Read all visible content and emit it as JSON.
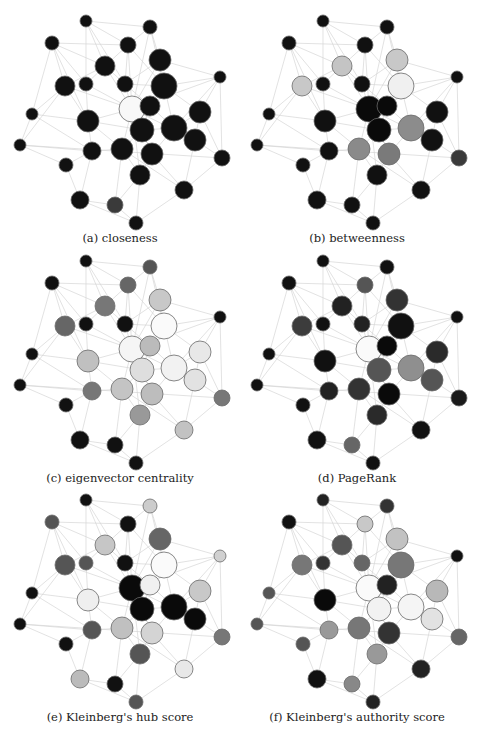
{
  "figure": {
    "panels": [
      {
        "id": "a",
        "caption": "(a) closeness",
        "offset": [
          0,
          0
        ],
        "fills": [
          "#111111",
          "#111111",
          "#111111",
          "#111111",
          "#111111",
          "#111111",
          "#111111",
          "#111111",
          "#111111",
          "#111111",
          "#111111",
          "#f8f8f8",
          "#111111",
          "#111111",
          "#111111",
          "#111111",
          "#111111",
          "#111111",
          "#111111",
          "#111111",
          "#111111",
          "#111111",
          "#111111",
          "#111111",
          "#111111",
          "#111111",
          "#111111",
          "#111111",
          "#3a3a3a",
          "#111111"
        ]
      },
      {
        "id": "b",
        "caption": "(b) betweenness",
        "offset": [
          237,
          0
        ],
        "fills": [
          "#111111",
          "#111111",
          "#111111",
          "#111111",
          "#c8c8c8",
          "#c4c4c4",
          "#c8c8c8",
          "#111111",
          "#111111",
          "#f0f0f0",
          "#111111",
          "#0a0a0a",
          "#0a0a0a",
          "#111111",
          "#111111",
          "#111111",
          "#0a0a0a",
          "#8c8c8c",
          "#111111",
          "#111111",
          "#111111",
          "#8a8a8a",
          "#7a7a7a",
          "#3a3a3a",
          "#111111",
          "#111111",
          "#111111",
          "#111111",
          "#111111",
          "#111111"
        ]
      },
      {
        "id": "c",
        "caption": "(c) eigenvector centrality",
        "offset": [
          0,
          240
        ],
        "fills": [
          "#111111",
          "#555555",
          "#111111",
          "#666666",
          "#c8c8c8",
          "#777777",
          "#666666",
          "#111111",
          "#111111",
          "#fafafa",
          "#111111",
          "#f5f5f5",
          "#bbbbbb",
          "#111111",
          "#c0c0c0",
          "#e8e8e8",
          "#dedede",
          "#f2f2f2",
          "#e2e2e2",
          "#111111",
          "#777777",
          "#c4c4c4",
          "#bdbdbd",
          "#777777",
          "#111111",
          "#999999",
          "#c2c2c2",
          "#111111",
          "#111111",
          "#111111"
        ]
      },
      {
        "id": "d",
        "caption": "(d) PageRank",
        "offset": [
          237,
          240
        ],
        "fills": [
          "#111111",
          "#111111",
          "#111111",
          "#555555",
          "#333333",
          "#222222",
          "#3c3c3c",
          "#111111",
          "#222222",
          "#111111",
          "#111111",
          "#fafafa",
          "#0a0a0a",
          "#111111",
          "#111111",
          "#2a2a2a",
          "#555555",
          "#8f8f8f",
          "#555555",
          "#111111",
          "#222222",
          "#333333",
          "#0a0a0a",
          "#1a1a1a",
          "#111111",
          "#2a2a2a",
          "#111111",
          "#111111",
          "#666666",
          "#111111"
        ]
      },
      {
        "id": "e",
        "caption": "(e) Kleinberg's hub score",
        "offset": [
          0,
          479
        ],
        "fills": [
          "#111111",
          "#cccccc",
          "#555555",
          "#111111",
          "#666666",
          "#c6c6c6",
          "#555555",
          "#555555",
          "#111111",
          "#fafafa",
          "#d0d0d0",
          "#0a0a0a",
          "#f0f0f0",
          "#111111",
          "#efefef",
          "#c8c8c8",
          "#0a0a0a",
          "#0a0a0a",
          "#0a0a0a",
          "#111111",
          "#555555",
          "#c0c0c0",
          "#d4d4d4",
          "#777777",
          "#111111",
          "#555555",
          "#e8e8e8",
          "#bbbbbb",
          "#111111",
          "#555555"
        ]
      },
      {
        "id": "f",
        "caption": "(f) Kleinberg's authority score",
        "offset": [
          237,
          479
        ],
        "fills": [
          "#222222",
          "#333333",
          "#111111",
          "#c8c8c8",
          "#c2c2c2",
          "#555555",
          "#777777",
          "#333333",
          "#666666",
          "#777777",
          "#111111",
          "#fafafa",
          "#222222",
          "#555555",
          "#0a0a0a",
          "#b8b8b8",
          "#f2f2f2",
          "#f5f5f5",
          "#e2e2e2",
          "#555555",
          "#999999",
          "#777777",
          "#333333",
          "#666666",
          "#555555",
          "#999999",
          "#222222",
          "#111111",
          "#888888",
          "#222222"
        ]
      }
    ],
    "bottom_caption_cropped": true
  },
  "graph": {
    "nodes": [
      {
        "x": 86,
        "y": 21,
        "r": 6
      },
      {
        "x": 150,
        "y": 27,
        "r": 7
      },
      {
        "x": 52,
        "y": 43,
        "r": 7
      },
      {
        "x": 128,
        "y": 45,
        "r": 8
      },
      {
        "x": 160,
        "y": 60,
        "r": 11
      },
      {
        "x": 105,
        "y": 66,
        "r": 10
      },
      {
        "x": 65,
        "y": 86,
        "r": 10
      },
      {
        "x": 86,
        "y": 84,
        "r": 7
      },
      {
        "x": 125,
        "y": 84,
        "r": 8
      },
      {
        "x": 164,
        "y": 86,
        "r": 13
      },
      {
        "x": 220,
        "y": 77,
        "r": 6
      },
      {
        "x": 132,
        "y": 109,
        "r": 13
      },
      {
        "x": 150,
        "y": 106,
        "r": 10
      },
      {
        "x": 32,
        "y": 114,
        "r": 6
      },
      {
        "x": 88,
        "y": 121,
        "r": 11
      },
      {
        "x": 200,
        "y": 112,
        "r": 11
      },
      {
        "x": 142,
        "y": 130,
        "r": 12
      },
      {
        "x": 174,
        "y": 128,
        "r": 13
      },
      {
        "x": 195,
        "y": 140,
        "r": 11
      },
      {
        "x": 20,
        "y": 145,
        "r": 6
      },
      {
        "x": 92,
        "y": 151,
        "r": 9
      },
      {
        "x": 122,
        "y": 149,
        "r": 11
      },
      {
        "x": 152,
        "y": 154,
        "r": 11
      },
      {
        "x": 222,
        "y": 158,
        "r": 8
      },
      {
        "x": 66,
        "y": 165,
        "r": 7
      },
      {
        "x": 140,
        "y": 175,
        "r": 10
      },
      {
        "x": 184,
        "y": 190,
        "r": 9
      },
      {
        "x": 80,
        "y": 200,
        "r": 9
      },
      {
        "x": 115,
        "y": 205,
        "r": 8
      },
      {
        "x": 136,
        "y": 223,
        "r": 7
      }
    ],
    "edges": [
      [
        1,
        2
      ],
      [
        1,
        4
      ],
      [
        1,
        8
      ],
      [
        1,
        6
      ],
      [
        1,
        9
      ],
      [
        2,
        4
      ],
      [
        2,
        5
      ],
      [
        2,
        10
      ],
      [
        2,
        12
      ],
      [
        3,
        6
      ],
      [
        3,
        7
      ],
      [
        3,
        8
      ],
      [
        3,
        14
      ],
      [
        3,
        15
      ],
      [
        3,
        4
      ],
      [
        4,
        9
      ],
      [
        4,
        6
      ],
      [
        4,
        12
      ],
      [
        4,
        10
      ],
      [
        5,
        10
      ],
      [
        5,
        11
      ],
      [
        5,
        12
      ],
      [
        5,
        9
      ],
      [
        6,
        8
      ],
      [
        6,
        9
      ],
      [
        6,
        12
      ],
      [
        6,
        7
      ],
      [
        7,
        14
      ],
      [
        7,
        15
      ],
      [
        7,
        12
      ],
      [
        8,
        12
      ],
      [
        8,
        15
      ],
      [
        9,
        12
      ],
      [
        9,
        13
      ],
      [
        9,
        10
      ],
      [
        10,
        11
      ],
      [
        10,
        16
      ],
      [
        10,
        13
      ],
      [
        10,
        18
      ],
      [
        11,
        16
      ],
      [
        11,
        24
      ],
      [
        11,
        12
      ],
      [
        12,
        13
      ],
      [
        12,
        17
      ],
      [
        12,
        15
      ],
      [
        12,
        22
      ],
      [
        13,
        18
      ],
      [
        13,
        17
      ],
      [
        14,
        20
      ],
      [
        14,
        15
      ],
      [
        14,
        21
      ],
      [
        15,
        21
      ],
      [
        15,
        22
      ],
      [
        15,
        17
      ],
      [
        16,
        18
      ],
      [
        16,
        19
      ],
      [
        16,
        24
      ],
      [
        17,
        23
      ],
      [
        17,
        22
      ],
      [
        17,
        18
      ],
      [
        18,
        19
      ],
      [
        18,
        23
      ],
      [
        19,
        24
      ],
      [
        19,
        27
      ],
      [
        20,
        21
      ],
      [
        20,
        25
      ],
      [
        20,
        24
      ],
      [
        21,
        25
      ],
      [
        21,
        28
      ],
      [
        21,
        22
      ],
      [
        22,
        26
      ],
      [
        22,
        29
      ],
      [
        23,
        26
      ],
      [
        23,
        27
      ],
      [
        24,
        27
      ],
      [
        25,
        28
      ],
      [
        26,
        30
      ],
      [
        26,
        29
      ],
      [
        27,
        30
      ],
      [
        28,
        29
      ],
      [
        28,
        30
      ],
      [
        29,
        30
      ],
      [
        26,
        12
      ],
      [
        23,
        12
      ],
      [
        19,
        12
      ],
      [
        18,
        11
      ],
      [
        27,
        22
      ],
      [
        7,
        20
      ]
    ]
  }
}
